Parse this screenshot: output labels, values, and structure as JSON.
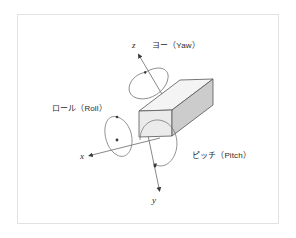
{
  "diagram": {
    "background_color": "#ffffff",
    "frame_color": "#e2e2e2",
    "line_color": "#555555",
    "labels": {
      "yaw": "ヨー（Yaw）",
      "roll": "ロール（Roll）",
      "pitch": "ピッチ（Pitch）"
    },
    "axes": [
      {
        "name": "z",
        "label": "z",
        "direction": "up-left",
        "rotation": "ヨー（Yaw）"
      },
      {
        "name": "x",
        "label": "x",
        "direction": "down-left",
        "rotation": "ロール（Roll）"
      },
      {
        "name": "y",
        "label": "y",
        "direction": "down",
        "rotation": "ピッチ（Pitch）"
      }
    ],
    "box": {
      "name": "rectangular-box",
      "top_face_color": "#f2f2f2",
      "front_face_color": "#e8e8e8",
      "side_face_color": "#cfcfcf",
      "edge_color": "#555555"
    }
  }
}
